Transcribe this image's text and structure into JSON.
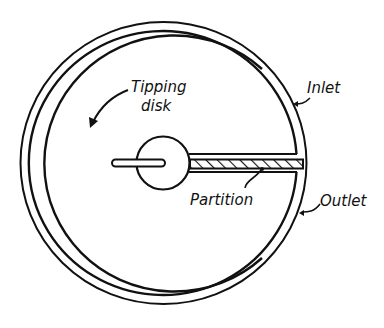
{
  "diagram": {
    "type": "tipping-disk-meter-cross-section",
    "labels": {
      "tipping_disk_line1": "Tipping",
      "tipping_disk_line2": "disk",
      "inlet": "Inlet",
      "outlet": "Outlet",
      "partition": "Partition"
    },
    "colors": {
      "ink": "#111111",
      "background": "#ffffff"
    }
  }
}
